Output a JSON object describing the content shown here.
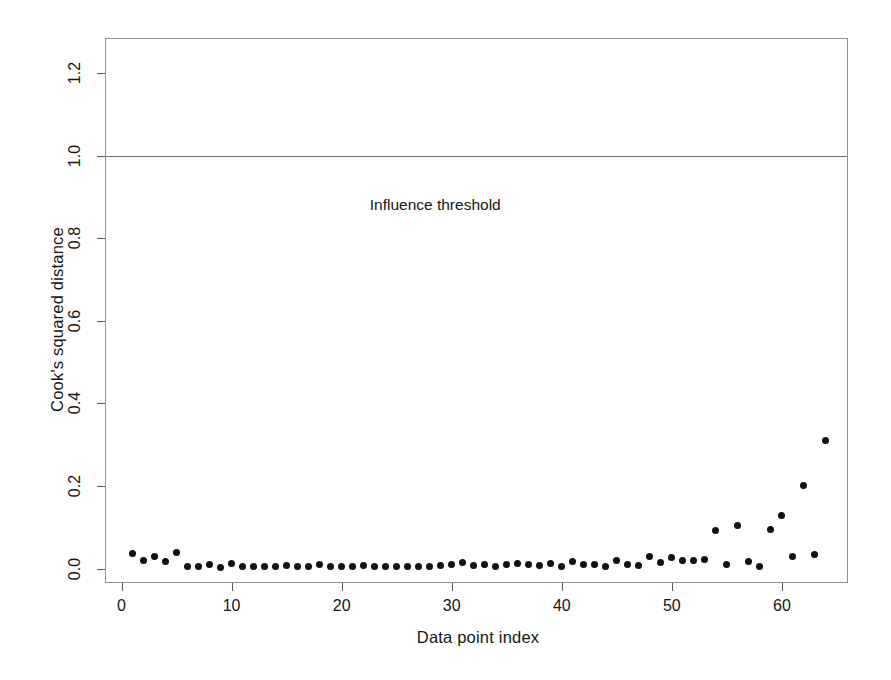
{
  "chart_data": {
    "type": "scatter",
    "title": "",
    "xlabel": "Data point index",
    "ylabel": "Cook's squared distance",
    "xlim": [
      -1.5,
      66.0
    ],
    "ylim": [
      -0.035,
      1.285
    ],
    "grid": false,
    "legend": "none",
    "annotations": [
      {
        "name": "influence-threshold-label",
        "text": "Influence threshold",
        "x": 28.5,
        "y": 0.88
      }
    ],
    "reference_lines": [
      {
        "name": "influence-threshold-line",
        "orientation": "horizontal",
        "y": 1.0,
        "color": "#6a6a6a"
      }
    ],
    "xticks": [
      0,
      10,
      20,
      30,
      40,
      50,
      60
    ],
    "xtick_labels": [
      "0",
      "10",
      "20",
      "30",
      "40",
      "50",
      "60"
    ],
    "yticks": [
      0.0,
      0.2,
      0.4,
      0.6,
      0.8,
      1.0,
      1.2
    ],
    "ytick_labels": [
      "0.0",
      "0.2",
      "0.4",
      "0.6",
      "0.8",
      "1.0",
      "1.2"
    ],
    "marker": "filled-circle",
    "marker_color": "#111111",
    "x": [
      1,
      2,
      3,
      4,
      5,
      6,
      7,
      8,
      9,
      10,
      11,
      12,
      13,
      14,
      15,
      16,
      17,
      18,
      19,
      20,
      21,
      22,
      23,
      24,
      25,
      26,
      27,
      28,
      29,
      30,
      31,
      32,
      33,
      34,
      35,
      36,
      37,
      38,
      39,
      40,
      41,
      42,
      43,
      44,
      45,
      46,
      47,
      48,
      49,
      50,
      51,
      52,
      53,
      54,
      55,
      56,
      57,
      58,
      59,
      60,
      61,
      62,
      63,
      64
    ],
    "y": [
      0.036,
      0.02,
      0.03,
      0.016,
      0.04,
      0.005,
      0.006,
      0.01,
      0.003,
      0.012,
      0.005,
      0.005,
      0.005,
      0.005,
      0.008,
      0.005,
      0.005,
      0.01,
      0.004,
      0.005,
      0.006,
      0.008,
      0.005,
      0.004,
      0.005,
      0.004,
      0.005,
      0.006,
      0.008,
      0.01,
      0.014,
      0.007,
      0.01,
      0.005,
      0.01,
      0.012,
      0.009,
      0.008,
      0.012,
      0.006,
      0.016,
      0.01,
      0.009,
      0.006,
      0.02,
      0.011,
      0.008,
      0.03,
      0.014,
      0.026,
      0.019,
      0.019,
      0.023,
      0.092,
      0.009,
      0.105,
      0.016,
      0.005,
      0.095,
      0.128,
      0.03,
      0.2,
      0.035,
      0.31
    ]
  }
}
